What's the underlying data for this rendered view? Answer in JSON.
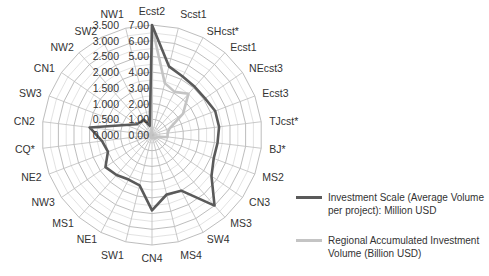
{
  "chart_data": {
    "type": "radar",
    "title": "",
    "categories": [
      "Ecst2",
      "Scst1",
      "SHcst*",
      "Ecst1",
      "NEcst3",
      "Ecst3",
      "TJcst*",
      "BJ*",
      "MS2",
      "CN3",
      "MS3",
      "SW4",
      "MS4",
      "CN4",
      "SW1",
      "NE1",
      "MS1",
      "NW3",
      "NE2",
      "CQ*",
      "CN2",
      "SW3",
      "CN1",
      "NW2",
      "SW2",
      "NW1"
    ],
    "radial_axes": {
      "primary": {
        "ticks": [
          "0.00",
          "1.00",
          "2.00",
          "3.00",
          "4.00",
          "5.00",
          "6.00",
          "7.00"
        ],
        "range": [
          0,
          7
        ]
      },
      "secondary": {
        "ticks": [
          "0.000",
          "0.500",
          "1.000",
          "1.500",
          "2.000",
          "2.500",
          "3.000",
          "3.500"
        ],
        "range": [
          0,
          3.5
        ]
      }
    },
    "series": [
      {
        "name": "Investment Scale (Average Volume per project): Million USD",
        "color": "#5a5a5a",
        "values": [
          7.0,
          4.5,
          4.2,
          4.1,
          4.1,
          4.3,
          4.3,
          4.2,
          4.2,
          4.6,
          6.0,
          4.0,
          3.9,
          4.8,
          3.3,
          3.2,
          3.4,
          3.6,
          3.0,
          3.2,
          4.0,
          1.8,
          1.2,
          1.1,
          1.1,
          0.6
        ]
      },
      {
        "name": "Regional Accumulated Investment Volume (Billion USD)",
        "color": "#c4c4c4",
        "values": [
          3.45,
          1.7,
          1.55,
          1.75,
          1.2,
          0.6,
          0.5,
          0.5,
          0.2,
          0.15,
          0.15,
          0.1,
          0.1,
          0.1,
          0.1,
          0.05,
          0.05,
          0.05,
          0.05,
          0.05,
          0.05,
          0.05,
          0.05,
          0.05,
          0.05,
          0.05
        ]
      }
    ],
    "legend_position": "right",
    "grid": true
  },
  "legend": [
    {
      "label": "Investment Scale (Average Volume per project): Million USD",
      "color": "#5a5a5a"
    },
    {
      "label": "Regional Accumulated Investment Volume (Billion USD)",
      "color": "#c4c4c4"
    }
  ]
}
